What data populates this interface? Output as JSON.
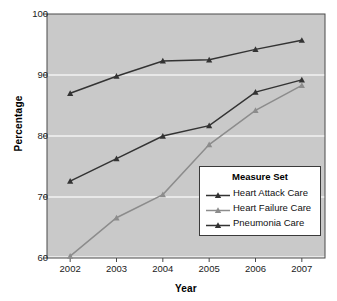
{
  "chart_data": {
    "type": "line",
    "title": "",
    "xlabel": "Year",
    "ylabel": "Percentage",
    "categories": [
      "2002",
      "2003",
      "2004",
      "2005",
      "2006",
      "2007"
    ],
    "x": [
      2002,
      2003,
      2004,
      2005,
      2006,
      2007
    ],
    "ylim": [
      60,
      100
    ],
    "xlim": [
      2002,
      2007
    ],
    "yticks": [
      "60",
      "70",
      "80",
      "90",
      "100"
    ],
    "ytick_values": [
      60,
      70,
      80,
      90,
      100
    ],
    "grid": "horizontal-white",
    "legend_position": "lower-right",
    "legend_title": "Measure Set",
    "plot_background": "#c9c9c9",
    "gridline_color": "#f2f2f2",
    "series": [
      {
        "name": "Heart Attack Care",
        "color": "#333333",
        "marker": "triangle",
        "values": [
          72.6,
          76.3,
          80.0,
          81.7,
          87.2,
          89.2
        ]
      },
      {
        "name": "Heart Failure Care",
        "color": "#8c8c8c",
        "marker": "triangle",
        "values": [
          60.3,
          66.6,
          70.4,
          78.6,
          84.2,
          88.3
        ]
      },
      {
        "name": "Pneumonia Care",
        "color": "#333333",
        "marker": "triangle",
        "values": [
          87.0,
          89.8,
          92.3,
          92.5,
          94.2,
          95.7
        ]
      }
    ]
  },
  "legend": {
    "title": "Measure Set",
    "items": [
      {
        "label": "Heart Attack Care",
        "color": "#333333"
      },
      {
        "label": "Heart Failure Care",
        "color": "#8c8c8c"
      },
      {
        "label": "Pneumonia Care",
        "color": "#333333"
      }
    ]
  },
  "axes": {
    "x_title": "Year",
    "y_title": "Percentage",
    "y_ticks": [
      "100",
      "90",
      "80",
      "70",
      "60"
    ],
    "x_ticks": [
      "2002",
      "2003",
      "2004",
      "2005",
      "2006",
      "2007"
    ]
  }
}
